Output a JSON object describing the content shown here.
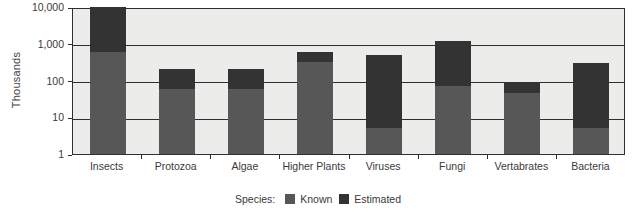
{
  "chart_data": {
    "type": "bar",
    "subtype": "stacked-bar",
    "scale": "log10",
    "title": "",
    "xlabel": "",
    "ylabel": "Thousands",
    "ylim": [
      1,
      10000
    ],
    "grid": true,
    "legend_position": "bottom",
    "legend_title": "Species:",
    "ytick_labels": [
      "10,000",
      "1,000",
      "100",
      "10",
      "1"
    ],
    "ytick_values": [
      10000,
      1000,
      100,
      10,
      1
    ],
    "categories": [
      "Insects",
      "Protozoa",
      "Algae",
      "Higher Plants",
      "Viruses",
      "Fungi",
      "Vertabrates",
      "Bacteria"
    ],
    "series": [
      {
        "name": "Known",
        "color": "#575757",
        "values": [
          600,
          60,
          60,
          320,
          5,
          70,
          45,
          5
        ]
      },
      {
        "name": "Estimated",
        "color": "#333333",
        "values": [
          10000,
          200,
          200,
          600,
          500,
          1200,
          90,
          300
        ]
      }
    ]
  },
  "legend": {
    "title": "Species:",
    "items": [
      {
        "label": "Known",
        "color": "#575757"
      },
      {
        "label": "Estimated",
        "color": "#333333"
      }
    ]
  },
  "axes": {
    "y_title": "Thousands"
  },
  "colors": {
    "plot_background": "#ececeb",
    "axis_line": "#2f2f2f",
    "known": "#575757",
    "estimated": "#333333",
    "text": "#3a3a3a"
  }
}
